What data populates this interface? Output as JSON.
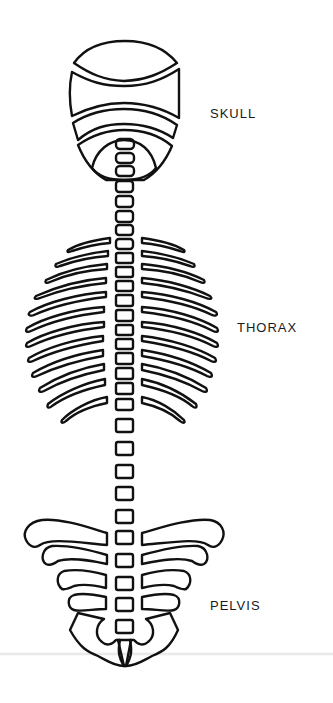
{
  "diagram": {
    "labels": {
      "skull": "SKULL",
      "thorax": "THORAX",
      "pelvis": "PELVIS"
    },
    "stroke_color": "#111111",
    "background": "#ffffff"
  }
}
